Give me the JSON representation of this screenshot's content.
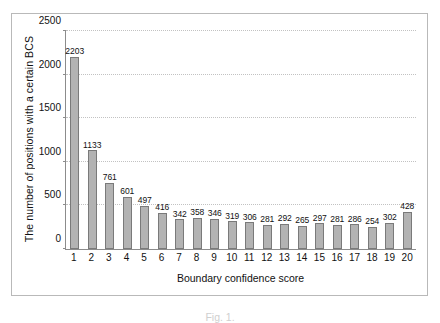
{
  "chart_data": {
    "type": "bar",
    "title": "",
    "xlabel": "Boundary confidence score",
    "ylabel": "The number of positions with a certain BCS",
    "categories": [
      "1",
      "2",
      "3",
      "4",
      "5",
      "6",
      "7",
      "8",
      "9",
      "10",
      "11",
      "12",
      "13",
      "14",
      "15",
      "16",
      "17",
      "18",
      "19",
      "20"
    ],
    "values": [
      2203,
      1133,
      761,
      601,
      497,
      416,
      342,
      358,
      346,
      319,
      306,
      281,
      292,
      265,
      297,
      281,
      286,
      254,
      302,
      428
    ],
    "ylim": [
      0,
      2500
    ],
    "yticks": [
      0,
      500,
      1000,
      1500,
      2000,
      2500
    ],
    "ytick_labels": [
      "0",
      "500",
      "1000",
      "1500",
      "2000",
      "2500"
    ],
    "grid": true,
    "legend": false,
    "bar_color": "#b3b3b3",
    "bar_border_color": "#7a7a7a",
    "gridline_color": "#c2c2c2",
    "axis_color": "#8c8c8c",
    "frame_color": "#b9b9b9"
  },
  "caption": {
    "text": "Fig. 1."
  }
}
